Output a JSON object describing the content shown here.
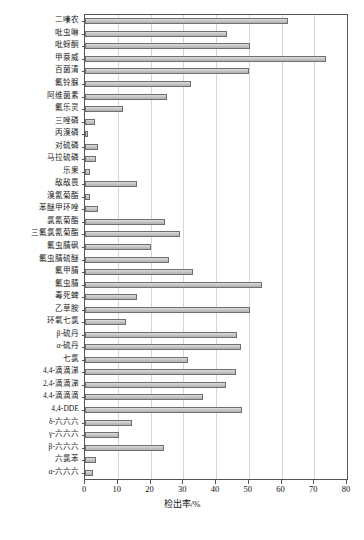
{
  "chart_data": {
    "type": "bar",
    "orientation": "horizontal",
    "title": "",
    "xlabel": "检出率/%",
    "ylabel": "",
    "xlim": [
      0,
      80
    ],
    "xticks": [
      0,
      10,
      20,
      30,
      40,
      50,
      60,
      70,
      80
    ],
    "grid": true,
    "legend": false,
    "bar_fill": "#c6c6c6",
    "bar_border": "#6f6f6f",
    "categories": [
      "二嗪农",
      "吡虫啉",
      "吡蚜酮",
      "甲萘威",
      "百菌清",
      "氟铃脲",
      "阿维菌素",
      "氟乐灵",
      "三唑磷",
      "丙溴磷",
      "对硫磷",
      "马拉硫磷",
      "乐果",
      "敌敌畏",
      "溴氰菊酯",
      "苯醚甲环唑",
      "氯氰菊酯",
      "三氟氯氰菊酯",
      "氟虫腈砜",
      "氟虫腈硫醚",
      "氟甲腈",
      "氟虫腈",
      "毒死蜱",
      "乙草胺",
      "环氧七氯",
      "β-硫丹",
      "α-硫丹",
      "七氯",
      "4,4-滴滴涕",
      "2,4-滴滴涕",
      "4,4-滴滴滴",
      "4,4-DDE",
      "δ-六六六",
      "γ-六六六",
      "β-六六六",
      "六氯苯",
      "α-六六六"
    ],
    "values": [
      62.0,
      43.5,
      50.5,
      73.5,
      50.0,
      32.5,
      25.0,
      11.5,
      3.0,
      1.0,
      4.0,
      3.5,
      1.5,
      16.0,
      1.5,
      4.0,
      24.5,
      29.0,
      20.0,
      25.5,
      33.0,
      54.0,
      16.0,
      50.5,
      12.5,
      46.5,
      47.5,
      31.5,
      46.0,
      43.0,
      36.0,
      48.0,
      14.5,
      10.5,
      24.0,
      3.5,
      2.5
    ]
  }
}
